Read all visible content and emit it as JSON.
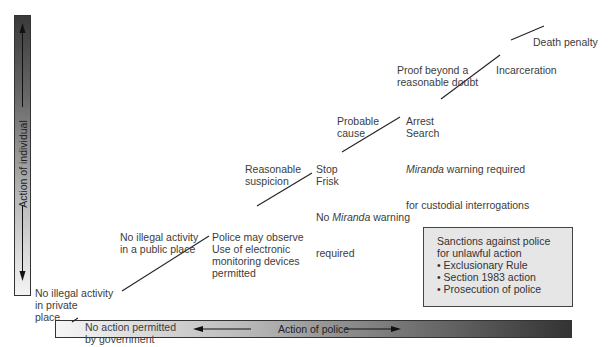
{
  "axes": {
    "vertical": {
      "label": "Action of individual"
    },
    "horizontal": {
      "label": "Action of police"
    }
  },
  "levels": [
    {
      "individual": [
        "No illegal activity",
        "in private",
        "place"
      ],
      "police": [
        "No action permitted",
        "by government"
      ]
    },
    {
      "individual": [
        "No illegal activity",
        "in a public place"
      ],
      "police": [
        "Police may observe",
        "Use of electronic",
        "monitoring devices",
        "permitted"
      ]
    },
    {
      "individual": [
        "Reasonable",
        "suspicion"
      ],
      "police": [
        "Stop",
        "Frisk",
        "No ",
        "Miranda",
        " warning",
        "required"
      ]
    },
    {
      "individual": [
        "Probable",
        "cause"
      ],
      "police": [
        "Arrest",
        "Search",
        "Miranda",
        " warning required",
        "for custodial interrogations"
      ]
    },
    {
      "individual": [
        "Proof beyond a",
        "reasonable doubt"
      ],
      "police": [
        "Incarceration"
      ]
    },
    {
      "individual": [],
      "police": [
        "Death penalty"
      ]
    }
  ],
  "sanctions_box": {
    "title_line1": "Sanctions against police",
    "title_line2": "for unlawful action",
    "items": [
      "• Exclusionary Rule",
      "• Section 1983 action",
      "• Prosecution of police"
    ]
  },
  "colors": {
    "text": "#3c3c3c",
    "line": "#222222",
    "box_fill": "#e6e6e6"
  }
}
